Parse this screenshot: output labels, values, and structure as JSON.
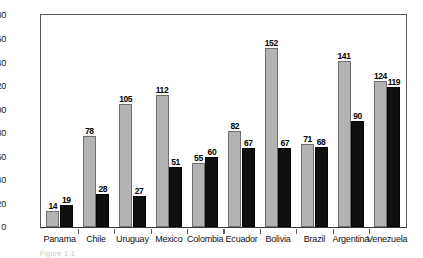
{
  "chart_data": {
    "type": "bar",
    "title": "",
    "subtitle": "",
    "xlabel": "",
    "ylabel": "",
    "ylim": [
      0,
      180
    ],
    "ytick_step": 20,
    "yticks": [
      0,
      20,
      40,
      60,
      80,
      100,
      120,
      140,
      160,
      180
    ],
    "grid": false,
    "legend": "none",
    "categories": [
      "Panama",
      "Chile",
      "Uruguay",
      "Mexico",
      "Colombia",
      "Ecuador",
      "Bolivia",
      "Brazil",
      "Argentina",
      "Venezuela"
    ],
    "series": [
      {
        "name": "series-light",
        "color": "#b3b3b3",
        "values": [
          14,
          78,
          105,
          112,
          55,
          82,
          152,
          71,
          141,
          124
        ]
      },
      {
        "name": "series-dark",
        "color": "#101010",
        "values": [
          19,
          28,
          27,
          51,
          60,
          67,
          67,
          68,
          90,
          119
        ]
      }
    ]
  },
  "caption": {
    "text": "Figure 1-1"
  }
}
